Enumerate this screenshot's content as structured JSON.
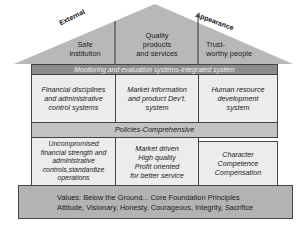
{
  "roof": {
    "left_label": "External",
    "right_label": "Appearance",
    "cells": [
      "Safe\ninstitution",
      "Quality\nproducts\nand services",
      "Trust-\nworthy people"
    ]
  },
  "monitoring_band": "Monitoring and evaluation systems-integrated system",
  "systems_row": [
    "Financial disciplines\nand administrative\ncontrol systems",
    "Market information\nand product Dev't.\nsystem",
    "Human resource\ndevelopment\nsystem"
  ],
  "policies_band": "Policies-Comprehensive",
  "pillars_row": [
    "Uncompromised\nfinancial strength and\nadministrative\ncontrols,standardize\noperations",
    "Market driven\nHigh quality\nProfit oriented\nfor better service",
    "Character\nCompetence\nCompensation"
  ],
  "foundation": {
    "line1": "Values: Below the Ground... Core Foundation Principles",
    "line2": "Attitude, Visionary, Honesty, Courageous, Integrity, Sacrifice"
  },
  "colors": {
    "roof": "#b8b8b8",
    "monitoring_band": "#8c8c8c",
    "policies_band": "#c2c2c2",
    "boxes": "#ececec",
    "foundation": "#b3b3b3"
  }
}
